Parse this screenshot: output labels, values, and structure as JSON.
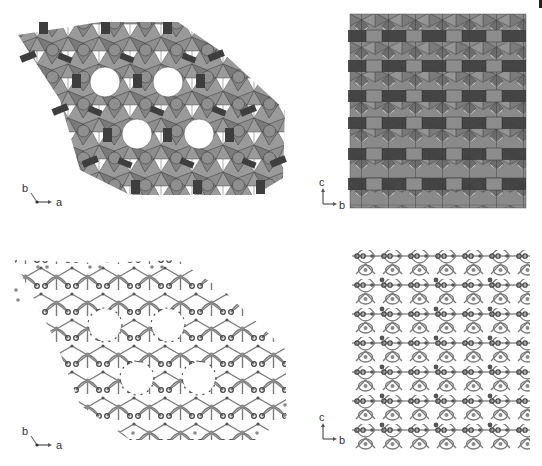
{
  "figure": {
    "panels": [
      {
        "id": "top-left",
        "representation": "polyhedral",
        "projection": "ab-plane",
        "axes": {
          "vertical": "b",
          "horizontal": "a"
        },
        "pores": 4
      },
      {
        "id": "top-right",
        "representation": "polyhedral",
        "projection": "bc-plane",
        "axes": {
          "vertical": "c",
          "horizontal": "b"
        }
      },
      {
        "id": "bottom-left",
        "representation": "ball-and-stick",
        "projection": "ab-plane",
        "axes": {
          "vertical": "b",
          "horizontal": "a"
        },
        "pores": 4
      },
      {
        "id": "bottom-right",
        "representation": "ball-and-stick",
        "projection": "bc-plane",
        "axes": {
          "vertical": "c",
          "horizontal": "b"
        }
      }
    ],
    "colors": {
      "background": "#ffffff",
      "polyhedron_light": "#8c8c8c",
      "polyhedron_dark": "#3f3f3f",
      "edge": "#2a2a2a",
      "atom_dark": "#444444",
      "atom_light": "#8a8a8a",
      "bond": "#777777",
      "axis": "#555555"
    }
  }
}
